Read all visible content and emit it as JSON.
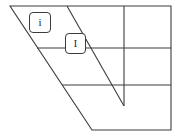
{
  "figure": {
    "kind": "line-diagram",
    "background_color": "#ffffff",
    "stroke_color": "#3c3c3c",
    "stroke_width": 1.1,
    "width": 180,
    "height": 137
  },
  "outline": {
    "name": "outer-boundary",
    "points": [
      [
        10,
        6
      ],
      [
        171,
        6
      ],
      [
        171,
        130
      ],
      [
        92,
        130
      ]
    ],
    "closed": true
  },
  "interior_lines": [
    {
      "name": "horizontal-line-upper",
      "orientation": "horizontal",
      "x1": 37,
      "y1": 48,
      "x2": 171,
      "y2": 48
    },
    {
      "name": "horizontal-line-lower",
      "orientation": "horizontal",
      "x1": 62,
      "y1": 85,
      "x2": 171,
      "y2": 85
    },
    {
      "name": "vertical-line-center",
      "orientation": "vertical",
      "x1": 124,
      "y1": 6,
      "x2": 124,
      "y2": 106
    },
    {
      "name": "diagonal-line-center",
      "orientation": "diagonal",
      "x1": 67,
      "y1": 6,
      "x2": 124,
      "y2": 106
    }
  ],
  "labels": [
    {
      "name": "label-chip-i-lower",
      "text": "i",
      "x": 29,
      "y": 12,
      "width": 22,
      "height": 21,
      "font_size": 11,
      "font_style": "normal"
    },
    {
      "name": "label-chip-i-upper",
      "text": "I",
      "x": 65,
      "y": 33,
      "width": 21,
      "height": 21,
      "font_size": 10,
      "font_style": "normal"
    }
  ]
}
